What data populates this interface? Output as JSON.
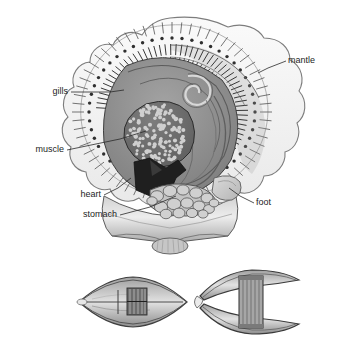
{
  "figure": {
    "background_color": "#ffffff",
    "ink_color": "#2a2a2a",
    "label_color": "#1d1d1d",
    "panels": [
      {
        "name": "main-cutaway",
        "caption": ""
      },
      {
        "name": "shell-closed-view",
        "caption": ""
      },
      {
        "name": "shell-open-view",
        "caption": ""
      }
    ]
  },
  "labels": [
    {
      "id": "mantle",
      "text": "mantle",
      "x": 288,
      "y": 61,
      "align": "start",
      "leader": [
        [
          286,
          61
        ],
        [
          268,
          68
        ],
        [
          258,
          73
        ]
      ]
    },
    {
      "id": "gills",
      "text": "gills",
      "x": 68,
      "y": 92,
      "align": "end",
      "leader": [
        [
          71,
          92
        ],
        [
          110,
          92
        ],
        [
          124,
          90
        ]
      ]
    },
    {
      "id": "muscle",
      "text": "muscle",
      "x": 64,
      "y": 150,
      "align": "end",
      "leader": [
        [
          67,
          150
        ],
        [
          120,
          139
        ],
        [
          146,
          131
        ]
      ]
    },
    {
      "id": "heart",
      "text": "heart",
      "x": 101,
      "y": 195,
      "align": "end",
      "leader": [
        [
          104,
          195
        ],
        [
          118,
          188
        ],
        [
          131,
          178
        ]
      ]
    },
    {
      "id": "stomach",
      "text": "stomach",
      "x": 117,
      "y": 215,
      "align": "end",
      "leader": [
        [
          120,
          215
        ],
        [
          150,
          207
        ],
        [
          176,
          196
        ]
      ]
    },
    {
      "id": "foot",
      "text": "foot",
      "x": 256,
      "y": 203,
      "align": "start",
      "leader": [
        [
          254,
          203
        ],
        [
          240,
          196
        ],
        [
          229,
          188
        ]
      ]
    }
  ],
  "structures": {
    "mantle": {
      "name": "mantle",
      "description": "scalloped outer mantle margin with radial tentacles and a ring of eye spots",
      "fill": "#f2f2f2",
      "stroke": "#6e6e6e",
      "tentacle_count": 64,
      "eye_dot_count": 52,
      "eye_dot_color": "#2f2f2f"
    },
    "gills": {
      "name": "gills",
      "description": "concentric rows of ctenidial filaments inside the mantle",
      "fill": "#9a9a9a",
      "stroke": "#3a3a3a",
      "filament_rows": 2,
      "filament_count": 58
    },
    "muscle": {
      "name": "adductor-muscle",
      "description": "large stippled adductor muscle, circular cross-section",
      "fill": "#6f6f6f",
      "stipple_color": "#cfcfcf",
      "stipple_count": 150
    },
    "heart": {
      "name": "heart",
      "description": "dark wedge-shaped heart below the adductor muscle",
      "fill": "#1f1f1f"
    },
    "stomach": {
      "name": "stomach",
      "description": "cluster of rounded digestive lobes at the base",
      "fill": "#b8b8b8",
      "stroke": "#4a4a4a",
      "lobe_count": 16
    },
    "foot": {
      "name": "foot",
      "description": "rounded muscular foot lobe on the lower right of the visceral mass",
      "fill": "#c8c8c8",
      "stroke": "#5a5a5a"
    },
    "visceral_mass": {
      "name": "visceral-mass",
      "description": "grey body mass with coiled gut spiral at the top",
      "fill": "#8a8a8a",
      "stroke": "#3c3c3c",
      "spiral_turns": 2.5
    },
    "shell_base": {
      "name": "shell-valve-base",
      "description": "flared shell valves meeting at a small hinge umbo at the bottom",
      "fill": "#e4e4e4",
      "stroke": "#5a5a5a"
    }
  },
  "lower_figures": [
    {
      "id": "shell-closed",
      "name": "closed-shell-side-view",
      "description": "lens-shaped closed bivalve shell seen edge-on with hatched central hinge block",
      "cx": 133,
      "cy": 302,
      "rx": 54,
      "ry": 23,
      "fill": "#bdbdbd",
      "stroke": "#3f3f3f",
      "hinge_hatch_lines": 7
    },
    {
      "id": "shell-open",
      "name": "open-shell-side-view",
      "description": "gaping bivalve shell forming a C with a tall striated adductor column between the valves",
      "cx": 248,
      "cy": 302,
      "rx": 52,
      "ry": 30,
      "fill": "#a8a8a8",
      "stroke": "#3f3f3f",
      "column_stripe_lines": 6
    }
  ]
}
